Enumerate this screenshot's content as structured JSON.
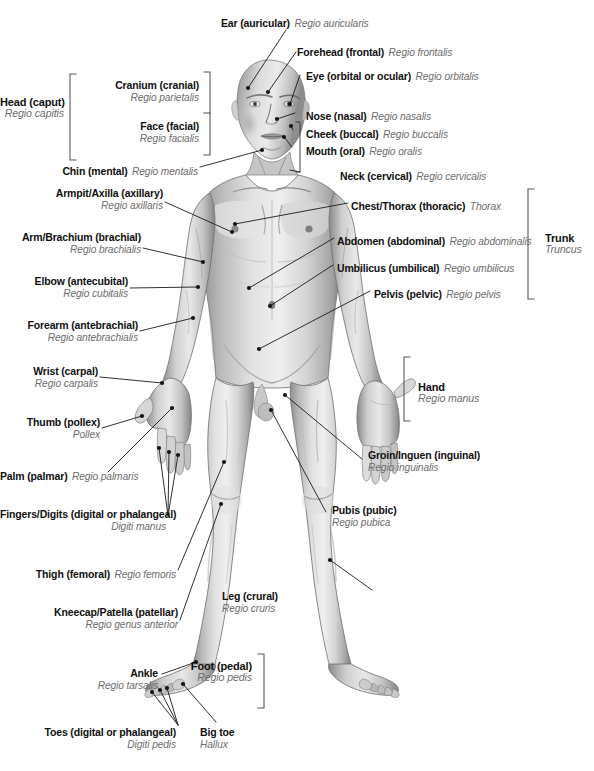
{
  "figure": {
    "background_color": "#ffffff",
    "text_color_english": "#101010",
    "text_color_latin": "#6d6d6d",
    "leader_line_color": "#1a1a1a",
    "bracket_color": "#555555"
  },
  "group_labels": [
    {
      "id": "head",
      "en": "Head (caput)",
      "la": "Regio capitis",
      "bracket": "right"
    },
    {
      "id": "trunk",
      "en": "Trunk",
      "la": "Truncus",
      "bracket": "left"
    },
    {
      "id": "hand",
      "en": "Hand",
      "la": "Regio manus",
      "bracket": "left"
    },
    {
      "id": "foot",
      "en": "Foot (pedal)",
      "la": "Regio pedis",
      "bracket": "left"
    }
  ],
  "labels": {
    "ear": {
      "en": "Ear (auricular)",
      "la": "Regio auricularis"
    },
    "forehead": {
      "en": "Forehead (frontal)",
      "la": "Regio frontalis"
    },
    "eye": {
      "en": "Eye (orbital or ocular)",
      "la": "Regio orbitalis"
    },
    "nose": {
      "en": "Nose (nasal)",
      "la": "Regio nasalis"
    },
    "cheek": {
      "en": "Cheek (buccal)",
      "la": "Regio buccalis"
    },
    "mouth": {
      "en": "Mouth (oral)",
      "la": "Regio oralis"
    },
    "neck": {
      "en": "Neck (cervical)",
      "la": "Regio cervicalis"
    },
    "cranium": {
      "en": "Cranium (cranial)",
      "la": "Regio parietalis"
    },
    "face": {
      "en": "Face (facial)",
      "la": "Regio facialis"
    },
    "chin": {
      "en": "Chin (mental)",
      "la": "Regio mentalis"
    },
    "head_group": {
      "en": "Head (caput)",
      "la": "Regio capitis"
    },
    "armpit": {
      "en": "Armpit/Axilla (axillary)",
      "la": "Regio axillaris"
    },
    "arm": {
      "en": "Arm/Brachium (brachial)",
      "la": "Regio brachialis"
    },
    "elbow": {
      "en": "Elbow (antecubital)",
      "la": "Regio cubitalis"
    },
    "forearm": {
      "en": "Forearm (antebrachial)",
      "la": "Regio antebrachialis"
    },
    "wrist": {
      "en": "Wrist (carpal)",
      "la": "Regio carpalis"
    },
    "thumb": {
      "en": "Thumb (pollex)",
      "la": "Pollex"
    },
    "palm": {
      "en": "Palm (palmar)",
      "la": "Regio palmaris"
    },
    "fingers": {
      "en": "Fingers/Digits (digital or phalangeal)",
      "la": "Digiti manus"
    },
    "thigh": {
      "en": "Thigh (femoral)",
      "la": "Regio femoris"
    },
    "kneecap": {
      "en": "Kneecap/Patella (patellar)",
      "la": "Regio genus anterior"
    },
    "ankle": {
      "en": "Ankle",
      "la": "Regio tarsalis"
    },
    "toes": {
      "en": "Toes (digital or phalangeal)",
      "la": "Digiti pedis"
    },
    "bigtoe": {
      "en": "Big toe",
      "la": "Hallux"
    },
    "chest": {
      "en": "Chest/Thorax (thoracic)",
      "la": "Thorax"
    },
    "abdomen": {
      "en": "Abdomen (abdominal)",
      "la": "Regio abdominalis"
    },
    "umbilicus": {
      "en": "Umbilicus (umbilical)",
      "la": "Regio umbilicus"
    },
    "pelvis": {
      "en": "Pelvis (pelvic)",
      "la": "Regio pelvis"
    },
    "trunk_group": {
      "en": "Trunk",
      "la": "Truncus"
    },
    "hand_group": {
      "en": "Hand",
      "la": "Regio manus"
    },
    "groin": {
      "en": "Groin/Inguen (inguinal)",
      "la": "Regio inguinalis"
    },
    "pubis": {
      "en": "Pubis (pubic)",
      "la": "Regio pubica"
    },
    "leg": {
      "en": "Leg (crural)",
      "la": "Regio cruris"
    },
    "foot_group": {
      "en": "Foot (pedal)",
      "la": "Regio pedis"
    }
  }
}
